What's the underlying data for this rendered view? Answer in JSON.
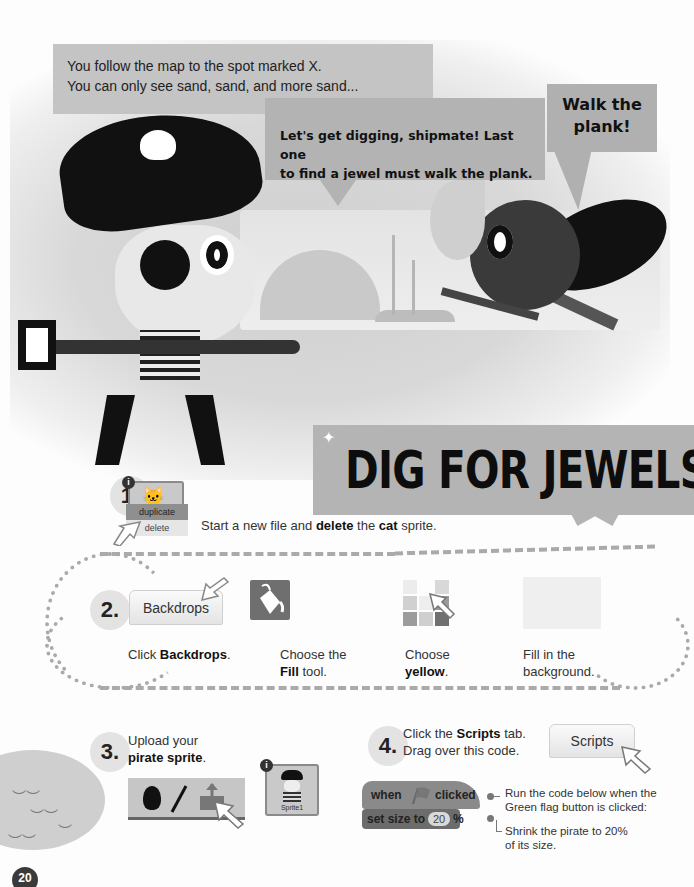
{
  "story": {
    "caption": [
      "You follow the map to the spot marked X.",
      "You can only see sand, sand, and more sand..."
    ],
    "pirate_speech": [
      "Let's get digging, shipmate! Last one",
      "to find a jewel must walk the plank."
    ],
    "parrot_speech": [
      "Walk the",
      "plank!"
    ]
  },
  "title": "DIG FOR JEWELS",
  "steps": {
    "step1": {
      "number": "1.",
      "menu": {
        "duplicate": "duplicate",
        "delete": "delete"
      },
      "info_badge": "i",
      "text": {
        "pre": "Start a new file and ",
        "b1": "delete",
        "mid": " the ",
        "b2": "cat",
        "post": " sprite."
      }
    },
    "step2": {
      "number": "2.",
      "backdrops_button": "Backdrops",
      "items": [
        {
          "pre": "Click ",
          "bold": "Backdrops",
          "post": "."
        },
        {
          "line1": "Choose the",
          "bold": "Fill",
          "post": " tool."
        },
        {
          "line1": "Choose",
          "bold": "yellow",
          "post": "."
        },
        {
          "line1": "Fill in the",
          "line2": "background."
        }
      ]
    },
    "step3": {
      "number": "3.",
      "line1": "Upload your",
      "bold": "pirate sprite",
      "post": ".",
      "sprite_label": "Sprite1",
      "info_badge": "i"
    },
    "step4": {
      "number": "4.",
      "line1_pre": "Click the ",
      "line1_bold": "Scripts",
      "line1_post": " tab.",
      "line2": "Drag over this code.",
      "scripts_button": "Scripts",
      "blocks": {
        "hat": {
          "when": "when",
          "clicked": "clicked"
        },
        "set_size": {
          "label": "set size to",
          "value": "20",
          "unit": "%"
        }
      },
      "annotations": [
        [
          "Run the code below when the",
          "Green flag button is clicked:"
        ],
        [
          "Shrink the pirate to 20%",
          "of its size."
        ]
      ]
    }
  },
  "page_number": "20",
  "colors": {
    "banner": "#b4b4b4",
    "badge": "#e3e3e3",
    "ink": "#111111"
  }
}
